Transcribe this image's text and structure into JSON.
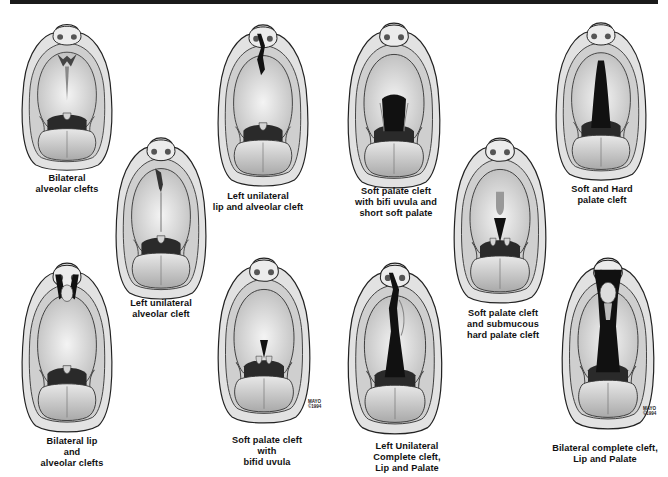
{
  "figure": {
    "header_bar_color": "#1a1a1a",
    "panels": [
      {
        "id": "bilateral-alveolar-clefts",
        "caption": [
          "Bilateral",
          "alveolar clefts"
        ],
        "cleft": "bilateral-alveolar",
        "box": [
          18,
          20,
          98,
          152
        ],
        "cap": [
          67,
          173
        ]
      },
      {
        "id": "left-unilateral-alveolar-cleft",
        "caption": [
          "Left unilateral",
          "alveolar cleft"
        ],
        "cleft": "left-alveolar",
        "box": [
          112,
          133,
          98,
          168
        ],
        "cap": [
          161,
          298
        ]
      },
      {
        "id": "left-unilateral-lip-alveolar-cleft",
        "caption": [
          "Left unilateral",
          "lip and alveolar cleft"
        ],
        "cleft": "left-lip-alveolar",
        "box": [
          214,
          20,
          98,
          168
        ],
        "cap": [
          258,
          191
        ]
      },
      {
        "id": "bilateral-lip-alveolar-clefts",
        "caption": [
          "Bilateral lip",
          "and",
          "alveolar clefts"
        ],
        "cleft": "bilateral-lip-alveolar",
        "box": [
          18,
          258,
          98,
          176
        ],
        "cap": [
          72,
          436
        ]
      },
      {
        "id": "soft-palate-cleft-bifid-uvula",
        "caption": [
          "Soft palate cleft",
          "with",
          "bifid uvula"
        ],
        "cleft": "soft-bifid",
        "box": [
          214,
          253,
          100,
          172
        ],
        "cap": [
          267,
          435
        ]
      },
      {
        "id": "soft-palate-cleft-bifid-short",
        "caption": [
          "Soft palate cleft",
          "with bifi uvula and",
          "short soft palate"
        ],
        "cleft": "soft-short",
        "box": [
          344,
          18,
          100,
          172
        ],
        "cap": [
          396,
          186
        ]
      },
      {
        "id": "soft-palate-submucous-hard",
        "caption": [
          "Soft palate cleft",
          "and submucous",
          "hard palate cleft"
        ],
        "cleft": "submucous",
        "box": [
          450,
          133,
          100,
          172
        ],
        "cap": [
          503,
          308
        ]
      },
      {
        "id": "soft-and-hard-palate-cleft",
        "caption": [
          "Soft and Hard",
          "palate cleft"
        ],
        "cleft": "soft-hard",
        "box": [
          552,
          18,
          98,
          164
        ],
        "cap": [
          602,
          184
        ]
      },
      {
        "id": "left-unilateral-complete-cleft",
        "caption": [
          "Left Unilateral",
          "Complete cleft,",
          "Lip and Palate"
        ],
        "cleft": "left-complete",
        "box": [
          344,
          258,
          102,
          178
        ],
        "cap": [
          407,
          441
        ]
      },
      {
        "id": "bilateral-complete-cleft",
        "caption": [
          "Bilateral complete cleft,",
          "Lip and Palate"
        ],
        "cleft": "bilateral-complete",
        "box": [
          558,
          253,
          100,
          178
        ],
        "cap": [
          605,
          443
        ]
      }
    ],
    "signatures": [
      {
        "text": [
          "MAYO",
          "©1994"
        ],
        "pos": [
          308,
          399
        ]
      },
      {
        "text": [
          "MAYO",
          "©1994"
        ],
        "pos": [
          643,
          406
        ]
      }
    ]
  }
}
